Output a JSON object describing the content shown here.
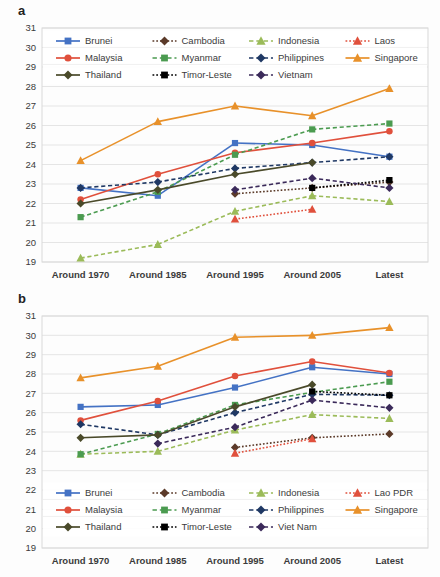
{
  "figure": {
    "panels": [
      {
        "label": "a",
        "id": "panel-a"
      },
      {
        "label": "b",
        "id": "panel-b"
      }
    ]
  },
  "colors": {
    "brunei": "#4472C4",
    "cambodia": "#5B3A29",
    "indonesia": "#9BBB59",
    "laos": "#E0503C",
    "malaysia": "#E0503C",
    "myanmar": "#4B9B50",
    "philippines": "#1F3864",
    "singapore": "#E8912A",
    "thailand": "#4A4A2A",
    "timor_leste": "#000000",
    "vietnam": "#3B2A5A",
    "gridline": "#E2E2E2",
    "axis_text": "#3B3B3B",
    "plot_border": "#D9D9D9",
    "background": "#FFFFFF"
  },
  "chart_data": [
    {
      "type": "line",
      "panel": "a",
      "title": "",
      "xlabel": "",
      "ylabel": "",
      "categories": [
        "Around 1970",
        "Around 1985",
        "Around 1995",
        "Around 2005",
        "Latest"
      ],
      "ylim": [
        19,
        31
      ],
      "yticks": [
        19,
        20,
        21,
        22,
        23,
        24,
        25,
        26,
        27,
        28,
        29,
        30,
        31
      ],
      "grid": true,
      "legend_position": "top-inside",
      "series": [
        {
          "name": "Brunei",
          "color": "#4472C4",
          "marker": "square",
          "dash": "solid",
          "values": [
            22.8,
            22.4,
            25.1,
            25.0,
            24.4
          ]
        },
        {
          "name": "Cambodia",
          "color": "#5B3A29",
          "marker": "diamond",
          "dash": "dotted",
          "values": [
            null,
            null,
            22.5,
            22.8,
            23.1
          ]
        },
        {
          "name": "Indonesia",
          "color": "#9BBB59",
          "marker": "triangle",
          "dash": "dashed",
          "values": [
            19.2,
            19.9,
            21.6,
            22.4,
            22.1
          ]
        },
        {
          "name": "Laos",
          "color": "#E0503C",
          "marker": "triangle",
          "dash": "dotted",
          "values": [
            null,
            null,
            21.2,
            21.7,
            null
          ]
        },
        {
          "name": "Malaysia",
          "color": "#E0503C",
          "marker": "circle",
          "dash": "solid",
          "values": [
            22.2,
            23.5,
            24.6,
            25.1,
            25.7
          ]
        },
        {
          "name": "Myanmar",
          "color": "#4B9B50",
          "marker": "square",
          "dash": "dashed",
          "values": [
            21.3,
            22.6,
            24.5,
            25.8,
            26.1
          ]
        },
        {
          "name": "Philippines",
          "color": "#1F3864",
          "marker": "diamond",
          "dash": "dashed",
          "values": [
            22.8,
            23.1,
            23.8,
            24.1,
            24.4
          ]
        },
        {
          "name": "Singapore",
          "color": "#E8912A",
          "marker": "triangle",
          "dash": "solid",
          "values": [
            24.2,
            26.2,
            27.0,
            26.5,
            27.9
          ]
        },
        {
          "name": "Thailand",
          "color": "#4A4A2A",
          "marker": "diamond",
          "dash": "solid",
          "values": [
            22.0,
            22.7,
            23.5,
            24.1,
            null
          ]
        },
        {
          "name": "Timor-Leste",
          "color": "#000000",
          "marker": "square",
          "dash": "dotted",
          "values": [
            null,
            null,
            null,
            22.8,
            23.2
          ]
        },
        {
          "name": "Vietnam",
          "color": "#3B2A5A",
          "marker": "diamond",
          "dash": "dashed",
          "values": [
            null,
            null,
            22.7,
            23.3,
            22.8
          ]
        }
      ],
      "legend": [
        {
          "name": "Brunei",
          "color": "#4472C4",
          "marker": "square",
          "dash": "solid"
        },
        {
          "name": "Cambodia",
          "color": "#5B3A29",
          "marker": "diamond",
          "dash": "dotted"
        },
        {
          "name": "Indonesia",
          "color": "#9BBB59",
          "marker": "triangle",
          "dash": "dashed"
        },
        {
          "name": "Laos",
          "color": "#E0503C",
          "marker": "triangle",
          "dash": "dotted"
        },
        {
          "name": "Malaysia",
          "color": "#E0503C",
          "marker": "circle",
          "dash": "solid"
        },
        {
          "name": "Myanmar",
          "color": "#4B9B50",
          "marker": "square",
          "dash": "dashed"
        },
        {
          "name": "Philippines",
          "color": "#1F3864",
          "marker": "diamond",
          "dash": "dashed"
        },
        {
          "name": "Singapore",
          "color": "#E8912A",
          "marker": "triangle",
          "dash": "solid"
        },
        {
          "name": "Thailand",
          "color": "#4A4A2A",
          "marker": "diamond",
          "dash": "solid"
        },
        {
          "name": "Timor-Leste",
          "color": "#000000",
          "marker": "square",
          "dash": "dotted"
        },
        {
          "name": "Vietnam",
          "color": "#3B2A5A",
          "marker": "diamond",
          "dash": "dashed"
        }
      ]
    },
    {
      "type": "line",
      "panel": "b",
      "title": "",
      "xlabel": "",
      "ylabel": "",
      "categories": [
        "Around 1970",
        "Around 1985",
        "Around 1995",
        "Around 2005",
        "Latest"
      ],
      "ylim": [
        19,
        31
      ],
      "yticks": [
        19,
        20,
        21,
        22,
        23,
        24,
        25,
        26,
        27,
        28,
        29,
        30,
        31
      ],
      "grid": true,
      "legend_position": "bottom-inside",
      "series": [
        {
          "name": "Brunei",
          "color": "#4472C4",
          "marker": "square",
          "dash": "solid",
          "values": [
            26.3,
            26.4,
            27.3,
            28.35,
            28.0
          ]
        },
        {
          "name": "Cambodia",
          "color": "#5B3A29",
          "marker": "diamond",
          "dash": "dotted",
          "values": [
            null,
            null,
            24.2,
            24.7,
            24.9
          ]
        },
        {
          "name": "Indonesia",
          "color": "#9BBB59",
          "marker": "triangle",
          "dash": "dashed",
          "values": [
            23.85,
            24.0,
            25.1,
            25.9,
            25.7
          ]
        },
        {
          "name": "Lao PDR",
          "color": "#E0503C",
          "marker": "triangle",
          "dash": "dotted",
          "values": [
            null,
            null,
            23.9,
            24.65,
            null
          ]
        },
        {
          "name": "Malaysia",
          "color": "#E0503C",
          "marker": "circle",
          "dash": "solid",
          "values": [
            25.6,
            26.6,
            27.9,
            28.65,
            28.05
          ]
        },
        {
          "name": "Myanmar",
          "color": "#4B9B50",
          "marker": "square",
          "dash": "dashed",
          "values": [
            23.85,
            24.9,
            26.4,
            27.05,
            27.6
          ]
        },
        {
          "name": "Philippines",
          "color": "#1F3864",
          "marker": "diamond",
          "dash": "dashed",
          "values": [
            25.4,
            24.85,
            26.0,
            26.95,
            26.9
          ]
        },
        {
          "name": "Singapore",
          "color": "#E8912A",
          "marker": "triangle",
          "dash": "solid",
          "values": [
            27.8,
            28.4,
            29.9,
            30.0,
            30.4
          ]
        },
        {
          "name": "Thailand",
          "color": "#4A4A2A",
          "marker": "diamond",
          "dash": "solid",
          "values": [
            24.7,
            24.85,
            26.3,
            27.45,
            null
          ]
        },
        {
          "name": "Timor-Leste",
          "color": "#000000",
          "marker": "square",
          "dash": "dotted",
          "values": [
            null,
            null,
            null,
            27.1,
            26.9
          ]
        },
        {
          "name": "Viet Nam",
          "color": "#3B2A5A",
          "marker": "diamond",
          "dash": "dashed",
          "values": [
            null,
            24.4,
            25.25,
            26.65,
            26.25
          ]
        }
      ],
      "legend": [
        {
          "name": "Brunei",
          "color": "#4472C4",
          "marker": "square",
          "dash": "solid"
        },
        {
          "name": "Cambodia",
          "color": "#5B3A29",
          "marker": "diamond",
          "dash": "dotted"
        },
        {
          "name": "Indonesia",
          "color": "#9BBB59",
          "marker": "triangle",
          "dash": "dashed"
        },
        {
          "name": "Lao PDR",
          "color": "#E0503C",
          "marker": "triangle",
          "dash": "dotted"
        },
        {
          "name": "Malaysia",
          "color": "#E0503C",
          "marker": "circle",
          "dash": "solid"
        },
        {
          "name": "Myanmar",
          "color": "#4B9B50",
          "marker": "square",
          "dash": "dashed"
        },
        {
          "name": "Philippines",
          "color": "#1F3864",
          "marker": "diamond",
          "dash": "dashed"
        },
        {
          "name": "Singapore",
          "color": "#E8912A",
          "marker": "triangle",
          "dash": "solid"
        },
        {
          "name": "Thailand",
          "color": "#4A4A2A",
          "marker": "diamond",
          "dash": "solid"
        },
        {
          "name": "Timor-Leste",
          "color": "#000000",
          "marker": "square",
          "dash": "dotted"
        },
        {
          "name": "Viet Nam",
          "color": "#3B2A5A",
          "marker": "diamond",
          "dash": "dashed"
        }
      ]
    }
  ]
}
